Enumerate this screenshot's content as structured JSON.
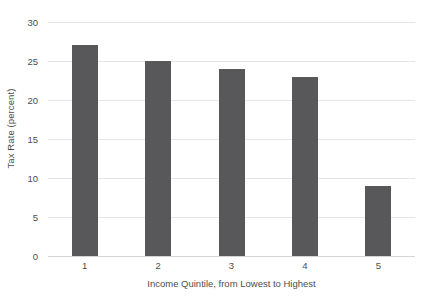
{
  "chart_data": {
    "type": "bar",
    "title": "",
    "categories": [
      "1",
      "2",
      "3",
      "4",
      "5"
    ],
    "values": [
      27,
      25,
      24,
      23,
      9
    ],
    "series": [
      {
        "name": "Tax Rate",
        "values": [
          27,
          25,
          24,
          23,
          9
        ]
      }
    ],
    "xlabel": "Income Quintile, from Lowest to Highest",
    "ylabel": "Tax Rate (percent)",
    "ylim": [
      0,
      30
    ],
    "yticks": [
      0,
      5,
      10,
      15,
      20,
      25,
      30
    ],
    "ytick_labels": [
      "0",
      "5",
      "10",
      "15",
      "20",
      "25",
      "30"
    ],
    "grid": true,
    "grid_axis": "y",
    "legend": false,
    "legend_position": "none",
    "colors": {
      "bar": "#58585a",
      "gridline": "#e6e6e6",
      "baseline": "#d4d4d4",
      "text": "#4d4d4d",
      "background": "#ffffff"
    }
  }
}
